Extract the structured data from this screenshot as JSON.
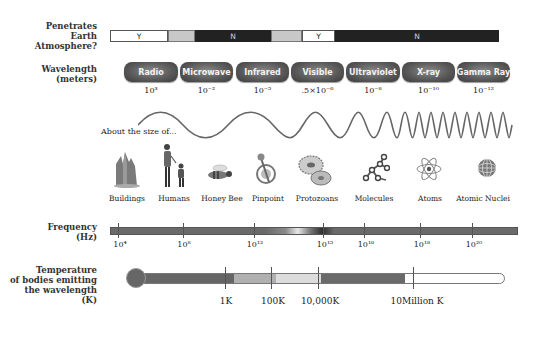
{
  "atmosphere": {
    "label": "Penetrates\nEarth\nAtmosphere?",
    "segments": [
      {
        "text": "Y",
        "kind": "yes"
      },
      {
        "text": "",
        "kind": "partial"
      },
      {
        "text": "N",
        "kind": "no"
      },
      {
        "text": "",
        "kind": "partial"
      },
      {
        "text": "Y",
        "kind": "yes"
      },
      {
        "text": "N",
        "kind": "no"
      }
    ]
  },
  "wavelength": {
    "label": "Wavelength\n(meters)",
    "bands": [
      {
        "name": "Radio",
        "value": "10³"
      },
      {
        "name": "Microwave",
        "value": "10⁻²"
      },
      {
        "name": "Infrared",
        "value": "10⁻⁵"
      },
      {
        "name": "Visible",
        "value": ".5×10⁻⁶"
      },
      {
        "name": "Ultraviolet",
        "value": "10⁻⁸"
      },
      {
        "name": "X-ray",
        "value": "10⁻¹⁰"
      },
      {
        "name": "Gamma Ray",
        "value": "10⁻¹²"
      }
    ]
  },
  "size_scale": {
    "label": "About the size of...",
    "objects": [
      {
        "name": "Buildings",
        "icon": "buildings-icon"
      },
      {
        "name": "Humans",
        "icon": "humans-icon"
      },
      {
        "name": "Honey Bee",
        "icon": "honey-bee-icon"
      },
      {
        "name": "Pinpoint",
        "icon": "pinpoint-icon"
      },
      {
        "name": "Protozoans",
        "icon": "protozoans-icon"
      },
      {
        "name": "Molecules",
        "icon": "molecules-icon"
      },
      {
        "name": "Atoms",
        "icon": "atoms-icon"
      },
      {
        "name": "Atomic Nuclei",
        "icon": "atomic-nuclei-icon"
      }
    ]
  },
  "frequency": {
    "label": "Frequency\n(Hz)",
    "ticks": [
      "10⁴",
      "10⁸",
      "10¹²",
      "10¹⁵",
      "10¹⁶",
      "10¹⁸",
      "10²⁰"
    ]
  },
  "temperature": {
    "label": "Temperature\nof bodies emitting\nthe wavelength\n(K)",
    "ticks": [
      "1K",
      "100K",
      "10,000K",
      "10Million K"
    ]
  },
  "colors": {
    "bar_dark": "#2a2a2a",
    "bar_mid": "#6e6e6e",
    "partial": "#c8c8c8",
    "freq_bar": "#6a6a6a",
    "temp_bar": "#666666",
    "temp_light": "#b0b0b0",
    "temp_lighter": "#dcdcdc"
  }
}
